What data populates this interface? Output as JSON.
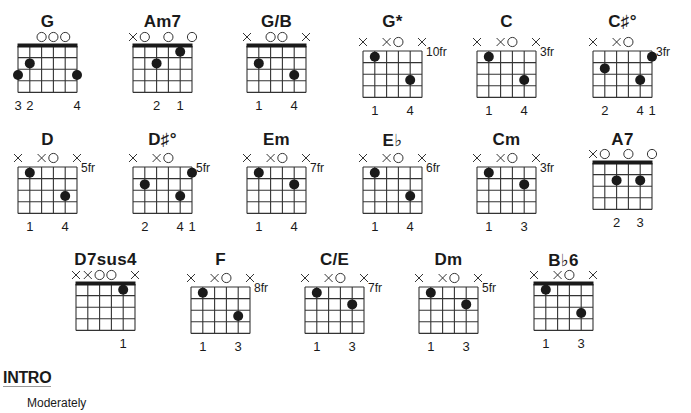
{
  "chords": [
    {
      "name": "G",
      "x": 18,
      "y": 46,
      "nut": true,
      "fret_label": "",
      "markers": [
        "",
        "",
        "O",
        "O",
        "O",
        ""
      ],
      "dots": [
        [
          1,
          2
        ],
        [
          0,
          3
        ],
        [
          5,
          3
        ]
      ],
      "fingers": [
        "3",
        "2",
        "",
        "",
        "",
        "4"
      ],
      "name_y": 12
    },
    {
      "name": "Am7",
      "x": 133,
      "y": 46,
      "nut": true,
      "fret_label": "",
      "markers": [
        "X",
        "O",
        "",
        "O",
        "",
        "O"
      ],
      "dots": [
        [
          4,
          1
        ],
        [
          2,
          2
        ]
      ],
      "fingers": [
        "",
        "",
        "2",
        "",
        "1",
        ""
      ],
      "name_y": 12
    },
    {
      "name": "G/B",
      "x": 247,
      "y": 46,
      "nut": true,
      "fret_label": "",
      "markers": [
        "X",
        "",
        "O",
        "O",
        "",
        "X"
      ],
      "dots": [
        [
          1,
          2
        ],
        [
          4,
          3
        ]
      ],
      "fingers": [
        "",
        "1",
        "",
        "",
        "4",
        ""
      ],
      "name_y": 12
    },
    {
      "name": "G*",
      "x": 363,
      "y": 51,
      "nut": false,
      "fret_label": "10fr",
      "markers": [
        "X",
        "",
        "X",
        "O",
        "",
        "X"
      ],
      "dots": [
        [
          1,
          1
        ],
        [
          4,
          3
        ]
      ],
      "fingers": [
        "",
        "1",
        "",
        "",
        "4",
        ""
      ],
      "name_y": 12
    },
    {
      "name": "C",
      "x": 477,
      "y": 51,
      "nut": false,
      "fret_label": "3fr",
      "markers": [
        "X",
        "",
        "X",
        "O",
        "",
        "X"
      ],
      "dots": [
        [
          1,
          1
        ],
        [
          4,
          3
        ]
      ],
      "fingers": [
        "",
        "1",
        "",
        "",
        "4",
        ""
      ],
      "name_y": 12
    },
    {
      "name": "C♯°",
      "x": 593,
      "y": 51,
      "nut": false,
      "fret_label": "3fr",
      "markers": [
        "X",
        "",
        "X",
        "O",
        "",
        ""
      ],
      "dots": [
        [
          5,
          1
        ],
        [
          1,
          2
        ],
        [
          4,
          3
        ]
      ],
      "fingers": [
        "",
        "2",
        "",
        "",
        "4",
        "1"
      ],
      "name_y": 12
    },
    {
      "name": "D",
      "x": 18,
      "y": 167,
      "nut": false,
      "fret_label": "5fr",
      "markers": [
        "X",
        "",
        "X",
        "O",
        "",
        "X"
      ],
      "dots": [
        [
          1,
          1
        ],
        [
          4,
          3
        ]
      ],
      "fingers": [
        "",
        "1",
        "",
        "",
        "4",
        ""
      ],
      "name_y": 130
    },
    {
      "name": "D♯°",
      "x": 133,
      "y": 167,
      "nut": false,
      "fret_label": "5fr",
      "markers": [
        "X",
        "",
        "X",
        "O",
        "",
        ""
      ],
      "dots": [
        [
          5,
          1
        ],
        [
          1,
          2
        ],
        [
          4,
          3
        ]
      ],
      "fingers": [
        "",
        "2",
        "",
        "",
        "4",
        "1"
      ],
      "name_y": 130
    },
    {
      "name": "Em",
      "x": 247,
      "y": 167,
      "nut": false,
      "fret_label": "7fr",
      "markers": [
        "X",
        "",
        "X",
        "O",
        "",
        "X"
      ],
      "dots": [
        [
          1,
          1
        ],
        [
          4,
          2
        ]
      ],
      "fingers": [
        "",
        "1",
        "",
        "",
        "4",
        ""
      ],
      "name_y": 130
    },
    {
      "name": "E♭",
      "x": 363,
      "y": 167,
      "nut": false,
      "fret_label": "6fr",
      "markers": [
        "X",
        "",
        "X",
        "O",
        "",
        "X"
      ],
      "dots": [
        [
          1,
          1
        ],
        [
          4,
          3
        ]
      ],
      "fingers": [
        "",
        "1",
        "",
        "",
        "4",
        ""
      ],
      "name_y": 130
    },
    {
      "name": "Cm",
      "x": 477,
      "y": 167,
      "nut": false,
      "fret_label": "3fr",
      "markers": [
        "X",
        "",
        "X",
        "O",
        "",
        "X"
      ],
      "dots": [
        [
          1,
          1
        ],
        [
          4,
          2
        ]
      ],
      "fingers": [
        "",
        "1",
        "",
        "",
        "3",
        ""
      ],
      "name_y": 130
    },
    {
      "name": "A7",
      "x": 593,
      "y": 163,
      "nut": true,
      "fret_label": "",
      "markers": [
        "X",
        "O",
        "",
        "O",
        "",
        "O"
      ],
      "dots": [
        [
          2,
          2
        ],
        [
          4,
          2
        ]
      ],
      "fingers": [
        "",
        "",
        "2",
        "",
        "3",
        ""
      ],
      "name_y": 130
    },
    {
      "name": "D7sus4",
      "x": 76,
      "y": 284,
      "nut": true,
      "fret_label": "",
      "markers": [
        "X",
        "X",
        "O",
        "O",
        "",
        "X"
      ],
      "dots": [
        [
          4,
          1
        ]
      ],
      "fingers": [
        "",
        "",
        "",
        "",
        "1",
        ""
      ],
      "name_y": 250
    },
    {
      "name": "F",
      "x": 191,
      "y": 287,
      "nut": false,
      "fret_label": "8fr",
      "markers": [
        "X",
        "",
        "X",
        "O",
        "",
        "X"
      ],
      "dots": [
        [
          1,
          1
        ],
        [
          4,
          3
        ]
      ],
      "fingers": [
        "",
        "1",
        "",
        "",
        "3",
        ""
      ],
      "name_y": 250
    },
    {
      "name": "C/E",
      "x": 305,
      "y": 287,
      "nut": false,
      "fret_label": "7fr",
      "markers": [
        "X",
        "",
        "X",
        "O",
        "",
        "X"
      ],
      "dots": [
        [
          1,
          1
        ],
        [
          4,
          2
        ]
      ],
      "fingers": [
        "",
        "1",
        "",
        "",
        "3",
        ""
      ],
      "name_y": 250
    },
    {
      "name": "Dm",
      "x": 419,
      "y": 287,
      "nut": false,
      "fret_label": "5fr",
      "markers": [
        "X",
        "",
        "X",
        "O",
        "",
        "X"
      ],
      "dots": [
        [
          1,
          1
        ],
        [
          4,
          2
        ]
      ],
      "fingers": [
        "",
        "1",
        "",
        "",
        "3",
        ""
      ],
      "name_y": 250
    },
    {
      "name": "B♭6",
      "x": 534,
      "y": 284,
      "nut": true,
      "fret_label": "",
      "markers": [
        "X",
        "",
        "X",
        "O",
        "",
        "X"
      ],
      "dots": [
        [
          1,
          1
        ],
        [
          4,
          3
        ]
      ],
      "fingers": [
        "",
        "1",
        "",
        "",
        "3",
        ""
      ],
      "name_y": 250
    }
  ],
  "section": {
    "title": "INTRO",
    "tempo": "Moderately"
  },
  "colors": {
    "ink": "#1a1a1a",
    "grid": "#333333"
  }
}
